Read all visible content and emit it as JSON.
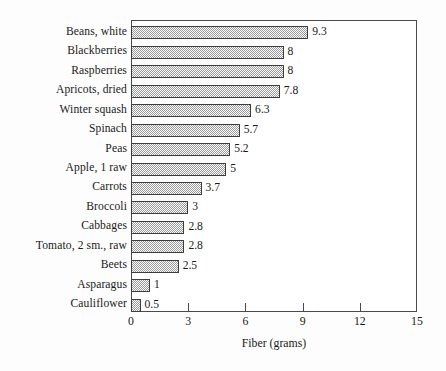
{
  "chart_data": {
    "type": "bar",
    "orientation": "horizontal",
    "title": "",
    "xlabel": "Fiber (grams)",
    "ylabel": "",
    "xlim": [
      0,
      15
    ],
    "xticks": [
      0,
      3,
      6,
      9,
      12,
      15
    ],
    "grid": false,
    "legend": false,
    "categories": [
      "Beans, white",
      "Blackberries",
      "Raspberries",
      "Apricots, dried",
      "Winter squash",
      "Spinach",
      "Peas",
      "Apple, 1 raw",
      "Carrots",
      "Broccoli",
      "Cabbages",
      "Tomato, 2 sm., raw",
      "Beets",
      "Asparagus",
      "Cauliflower"
    ],
    "values": [
      9.3,
      8,
      8,
      7.8,
      6.3,
      5.7,
      5.2,
      5,
      3.7,
      3,
      2.8,
      2.8,
      2.5,
      1,
      0.5
    ],
    "value_labels": [
      "9.3",
      "8",
      "8",
      "7.8",
      "6.3",
      "5.7",
      "5.2",
      "5",
      "3.7",
      "3",
      "2.8",
      "2.8",
      "2.5",
      "1",
      "0.5"
    ],
    "bar_fill": "#9a9a9a",
    "bar_border": "#3d3d3d",
    "axis_color": "#4a4a4a",
    "background": "#fdfdfd"
  }
}
